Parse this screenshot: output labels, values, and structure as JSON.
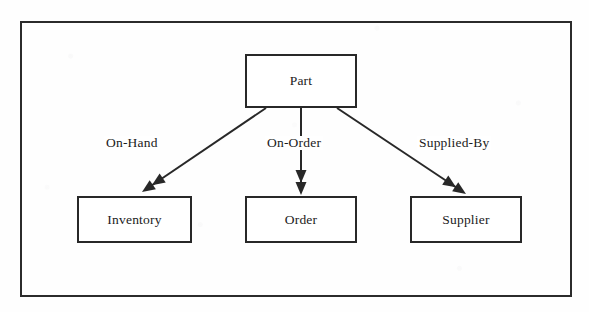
{
  "diagram": {
    "type": "entity-relationship-diagram",
    "colors": {
      "stroke": "#282828",
      "text": "#1b1b1b",
      "background": "#ffffff",
      "frame": "#2b2b2b"
    },
    "frame": {
      "x": 21,
      "y": 22,
      "width": 550,
      "height": 274
    },
    "nodes": [
      {
        "id": "part",
        "label": "Part",
        "x": 245,
        "y": 54,
        "width": 112,
        "height": 54
      },
      {
        "id": "inventory",
        "label": "Inventory",
        "x": 77,
        "y": 196,
        "width": 115,
        "height": 47
      },
      {
        "id": "order",
        "label": "Order",
        "x": 245,
        "y": 196,
        "width": 112,
        "height": 47
      },
      {
        "id": "supplier",
        "label": "Supplier",
        "x": 410,
        "y": 196,
        "width": 112,
        "height": 47
      }
    ],
    "edges": [
      {
        "id": "on-hand",
        "label": "On-Hand",
        "from": "part",
        "to": "inventory",
        "label_x": 104,
        "label_y": 136,
        "x1": 266,
        "y1": 108,
        "x2": 142,
        "y2": 192,
        "arrowhead": "double-filled"
      },
      {
        "id": "on-order",
        "label": "On-Order",
        "from": "part",
        "to": "order",
        "label_x": 265,
        "label_y": 136,
        "x1": 301,
        "y1": 108,
        "x2": 301,
        "y2": 195,
        "arrowhead": "double-filled"
      },
      {
        "id": "supplied-by",
        "label": "Supplied-By",
        "from": "part",
        "to": "supplier",
        "label_x": 417,
        "label_y": 136,
        "x1": 337,
        "y1": 108,
        "x2": 466,
        "y2": 194,
        "arrowhead": "double-filled"
      }
    ]
  }
}
